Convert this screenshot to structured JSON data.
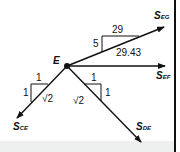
{
  "diagram": {
    "type": "free-body-diagram",
    "node": {
      "label": "E"
    },
    "forces": [
      {
        "symbol": "S",
        "subscript": "EG",
        "direction": "up-right"
      },
      {
        "symbol": "S",
        "subscript": "EF",
        "direction": "right"
      },
      {
        "symbol": "S",
        "subscript": "CE",
        "direction": "down-left"
      },
      {
        "symbol": "S",
        "subscript": "DE",
        "direction": "down-right"
      }
    ],
    "slope_triangles": {
      "eg": {
        "rise": "5",
        "run": "29",
        "hyp": "29.43"
      },
      "ce": {
        "rise": "1",
        "run": "1",
        "hyp": "√2"
      },
      "de": {
        "rise": "1",
        "run": "1",
        "hyp": "√2"
      }
    }
  },
  "colors": {
    "ink": "#111111",
    "background": "#ffffff",
    "band": "#eef0f0"
  }
}
